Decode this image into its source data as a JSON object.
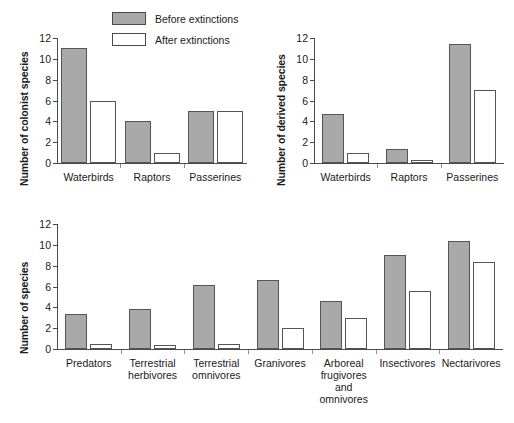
{
  "legend": {
    "items": [
      {
        "label": "Before extinctions",
        "style": "filled",
        "color": "#a9a9a9"
      },
      {
        "label": "After extinctions",
        "style": "empty",
        "color": "#ffffff"
      }
    ]
  },
  "chart_data": [
    {
      "id": "colonist",
      "type": "bar",
      "title": "",
      "ylabel": "Number of colonist species",
      "xlabel": "",
      "categories": [
        "Waterbirds",
        "Raptors",
        "Passerines"
      ],
      "series": [
        {
          "name": "Before extinctions",
          "values": [
            11,
            4,
            5
          ]
        },
        {
          "name": "After extinctions",
          "values": [
            6,
            1,
            5
          ]
        }
      ],
      "ylim": [
        0,
        12
      ],
      "yticks": [
        0,
        2,
        4,
        6,
        8,
        10,
        12
      ],
      "grid": false,
      "legend_position": "top-center"
    },
    {
      "id": "derived",
      "type": "bar",
      "title": "",
      "ylabel": "Number of derived species",
      "xlabel": "",
      "categories": [
        "Waterbirds",
        "Raptors",
        "Passerines"
      ],
      "series": [
        {
          "name": "Before extinctions",
          "values": [
            4.7,
            1.3,
            11.4
          ]
        },
        {
          "name": "After extinctions",
          "values": [
            1.0,
            0.25,
            7.0
          ]
        }
      ],
      "ylim": [
        0,
        12
      ],
      "yticks": [
        0,
        2,
        4,
        6,
        8,
        10,
        12
      ],
      "grid": false,
      "legend_position": "none"
    },
    {
      "id": "guilds",
      "type": "bar",
      "title": "",
      "ylabel": "Number of species",
      "xlabel": "",
      "categories": [
        "Predators",
        "Terrestrial\nherbivores",
        "Terrestrial\nomnivores",
        "Granivores",
        "Arboreal\nfrugivores\nand\nomnivores",
        "Insectivores",
        "Nectarivores"
      ],
      "series": [
        {
          "name": "Before extinctions",
          "values": [
            3.4,
            3.8,
            6.1,
            6.6,
            4.6,
            9.0,
            10.4
          ]
        },
        {
          "name": "After extinctions",
          "values": [
            0.5,
            0.4,
            0.5,
            2.0,
            3.0,
            5.6,
            8.4
          ]
        }
      ],
      "ylim": [
        0,
        12
      ],
      "yticks": [
        0,
        2,
        4,
        6,
        8,
        10,
        12
      ],
      "grid": false,
      "legend_position": "none"
    }
  ]
}
